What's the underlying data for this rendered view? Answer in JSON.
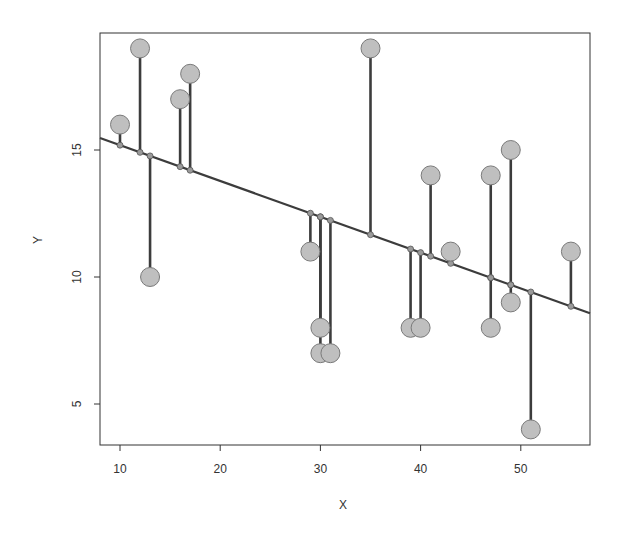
{
  "chart_data": {
    "type": "scatter",
    "title": "",
    "xlabel": "X",
    "ylabel": "Y",
    "xlim": [
      8,
      57
    ],
    "ylim": [
      3.3,
      19.5
    ],
    "xticks": [
      10,
      20,
      30,
      40,
      50
    ],
    "yticks": [
      5,
      10,
      15
    ],
    "xtick_labels": [
      "10",
      "20",
      "30",
      "40",
      "50"
    ],
    "ytick_labels": [
      "5",
      "10",
      "15"
    ],
    "grid": false,
    "legend": null,
    "points": [
      {
        "x": 10,
        "y": 16
      },
      {
        "x": 12,
        "y": 19
      },
      {
        "x": 13,
        "y": 10
      },
      {
        "x": 16,
        "y": 17
      },
      {
        "x": 17,
        "y": 18
      },
      {
        "x": 29,
        "y": 11
      },
      {
        "x": 30,
        "y": 8
      },
      {
        "x": 30,
        "y": 7
      },
      {
        "x": 31,
        "y": 7
      },
      {
        "x": 35,
        "y": 19
      },
      {
        "x": 39,
        "y": 8
      },
      {
        "x": 40,
        "y": 8
      },
      {
        "x": 41,
        "y": 14
      },
      {
        "x": 43,
        "y": 11
      },
      {
        "x": 47,
        "y": 14
      },
      {
        "x": 47,
        "y": 8
      },
      {
        "x": 49,
        "y": 15
      },
      {
        "x": 49,
        "y": 9
      },
      {
        "x": 51,
        "y": 4
      },
      {
        "x": 55,
        "y": 11
      }
    ],
    "regression_line": {
      "intercept": 16.6,
      "slope": -0.141
    },
    "residual_segments": true,
    "annotations": []
  },
  "style": {
    "point_fill": "#bfbfbf",
    "point_stroke": "#7a7a7a",
    "line_color": "#3c3c3c",
    "axis_color": "#333333"
  }
}
